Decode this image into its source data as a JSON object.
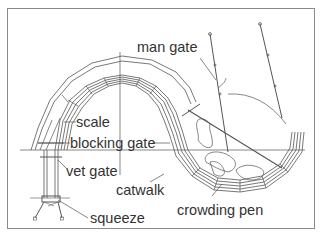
{
  "diagram": {
    "type": "livestock handling facility layout (curved chute)",
    "labels": {
      "man_gate": "man gate",
      "scale": "scale",
      "blocking_gate": "blocking gate",
      "vet_gate": "vet gate",
      "catwalk": "catwalk",
      "squeeze": "squeeze",
      "crowding_pen": "crowding pen"
    },
    "colors": {
      "line": "#555555",
      "text": "#333333",
      "border": "#8a8a8a",
      "background": "#ffffff"
    }
  }
}
